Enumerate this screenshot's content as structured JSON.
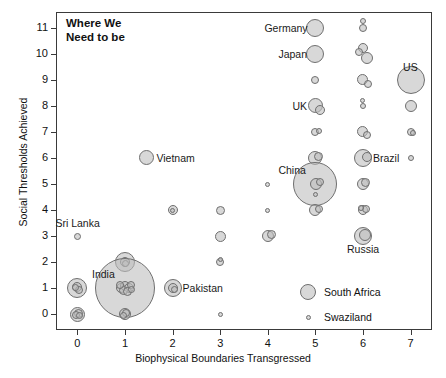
{
  "chart_data": {
    "type": "scatter",
    "title": "Where We\nNeed to be",
    "xlabel": "Biophysical Boundaries Transgressed",
    "ylabel": "Social Thresholds Achieved",
    "xlim": [
      -0.45,
      7.45
    ],
    "ylim": [
      -0.6,
      11.6
    ],
    "xticks": [
      0,
      1,
      2,
      3,
      4,
      5,
      6,
      7
    ],
    "yticks": [
      0,
      1,
      2,
      3,
      4,
      5,
      6,
      7,
      8,
      9,
      10,
      11
    ],
    "grid": false,
    "legend_position": "inside-bottom-right",
    "bubble_fill": "#bebebe",
    "bubble_stroke": "#6f6f6f",
    "size_note": "bubble radius encodes population",
    "legend": [
      {
        "label": "South Africa",
        "r": 8
      },
      {
        "label": "Swaziland",
        "r": 2.5
      }
    ],
    "annotations": [
      {
        "label": "Germany",
        "x": 5,
        "y": 11,
        "side": "left"
      },
      {
        "label": "Japan",
        "x": 5,
        "y": 10,
        "side": "left"
      },
      {
        "label": "US",
        "x": 7,
        "y": 9,
        "side": "above"
      },
      {
        "label": "UK",
        "x": 5,
        "y": 8,
        "side": "left"
      },
      {
        "label": "Brazil",
        "x": 6,
        "y": 6,
        "side": "right"
      },
      {
        "label": "China",
        "x": 5,
        "y": 5,
        "side": "above-left"
      },
      {
        "label": "Russia",
        "x": 6,
        "y": 3,
        "side": "below"
      },
      {
        "label": "Vietnam",
        "x": 1.45,
        "y": 6,
        "side": "right"
      },
      {
        "label": "Sri Lanka",
        "x": 0,
        "y": 3,
        "side": "above"
      },
      {
        "label": "India",
        "x": 1,
        "y": 1,
        "side": "above-left"
      },
      {
        "label": "Pakistan",
        "x": 2,
        "y": 1,
        "side": "right"
      }
    ],
    "points": [
      {
        "x": 5,
        "y": 11,
        "r": 9
      },
      {
        "x": 6,
        "y": 11,
        "r": 4
      },
      {
        "x": 6,
        "y": 11.25,
        "r": 3
      },
      {
        "x": 5,
        "y": 10,
        "r": 9
      },
      {
        "x": 6,
        "y": 10.2,
        "r": 5
      },
      {
        "x": 6.08,
        "y": 9.85,
        "r": 6
      },
      {
        "x": 5.92,
        "y": 10.05,
        "r": 4
      },
      {
        "x": 5,
        "y": 9,
        "r": 4
      },
      {
        "x": 6,
        "y": 9,
        "r": 5.5
      },
      {
        "x": 6.1,
        "y": 8.85,
        "r": 4
      },
      {
        "x": 7,
        "y": 9,
        "r": 14
      },
      {
        "x": 5,
        "y": 8,
        "r": 7.5
      },
      {
        "x": 5.1,
        "y": 7.85,
        "r": 5
      },
      {
        "x": 6,
        "y": 8,
        "r": 3
      },
      {
        "x": 6,
        "y": 8.2,
        "r": 2.5
      },
      {
        "x": 7,
        "y": 8,
        "r": 6
      },
      {
        "x": 5,
        "y": 7,
        "r": 4
      },
      {
        "x": 5.08,
        "y": 7.05,
        "r": 3
      },
      {
        "x": 6,
        "y": 7,
        "r": 5.5
      },
      {
        "x": 6.08,
        "y": 6.9,
        "r": 4
      },
      {
        "x": 7,
        "y": 7,
        "r": 4
      },
      {
        "x": 7.05,
        "y": 6.95,
        "r": 3
      },
      {
        "x": 5,
        "y": 6,
        "r": 7
      },
      {
        "x": 5.06,
        "y": 6.05,
        "r": 4.5
      },
      {
        "x": 6,
        "y": 6,
        "r": 9
      },
      {
        "x": 6.08,
        "y": 6.05,
        "r": 5
      },
      {
        "x": 7,
        "y": 6,
        "r": 3
      },
      {
        "x": 5,
        "y": 5,
        "r": 22
      },
      {
        "x": 5.02,
        "y": 5.0,
        "r": 6
      },
      {
        "x": 5.1,
        "y": 5.08,
        "r": 4
      },
      {
        "x": 6,
        "y": 5,
        "r": 6
      },
      {
        "x": 6.06,
        "y": 5.06,
        "r": 4.5
      },
      {
        "x": 4,
        "y": 5,
        "r": 2.5
      },
      {
        "x": 1.45,
        "y": 6,
        "r": 7.5
      },
      {
        "x": 6,
        "y": 4,
        "r": 5
      },
      {
        "x": 6.06,
        "y": 4.06,
        "r": 4
      },
      {
        "x": 5.95,
        "y": 4.08,
        "r": 3
      },
      {
        "x": 2,
        "y": 4,
        "r": 5
      },
      {
        "x": 2,
        "y": 4,
        "r": 2.5
      },
      {
        "x": 3,
        "y": 4,
        "r": 4.5
      },
      {
        "x": 4,
        "y": 4,
        "r": 2.5
      },
      {
        "x": 0,
        "y": 3,
        "r": 3.5
      },
      {
        "x": 3,
        "y": 3,
        "r": 5.5
      },
      {
        "x": 4,
        "y": 3,
        "r": 6
      },
      {
        "x": 4.08,
        "y": 3.05,
        "r": 4.5
      },
      {
        "x": 6,
        "y": 3,
        "r": 9
      },
      {
        "x": 6.05,
        "y": 3.05,
        "r": 6
      },
      {
        "x": 5,
        "y": 4,
        "r": 6
      },
      {
        "x": 5.08,
        "y": 4.05,
        "r": 4
      },
      {
        "x": 1,
        "y": 2,
        "r": 10
      },
      {
        "x": 1,
        "y": 2,
        "r": 5
      },
      {
        "x": 1.02,
        "y": 1.97,
        "r": 3.5
      },
      {
        "x": 3,
        "y": 2,
        "r": 4
      },
      {
        "x": 3,
        "y": 2.1,
        "r": 2.5
      },
      {
        "x": 1,
        "y": 1,
        "r": 30
      },
      {
        "x": 0.92,
        "y": 1.0,
        "r": 5
      },
      {
        "x": 1.0,
        "y": 1.08,
        "r": 5
      },
      {
        "x": 1.08,
        "y": 1.02,
        "r": 5
      },
      {
        "x": 0.96,
        "y": 0.9,
        "r": 4.5
      },
      {
        "x": 1.05,
        "y": 0.88,
        "r": 4.5
      },
      {
        "x": 1.12,
        "y": 1.12,
        "r": 4
      },
      {
        "x": 0.9,
        "y": 1.12,
        "r": 4
      },
      {
        "x": 1.14,
        "y": 0.95,
        "r": 3.5
      },
      {
        "x": 0,
        "y": 1,
        "r": 10
      },
      {
        "x": 0,
        "y": 1.05,
        "r": 5
      },
      {
        "x": 0.04,
        "y": 0.95,
        "r": 4
      },
      {
        "x": -0.04,
        "y": 1.02,
        "r": 3.5
      },
      {
        "x": 2,
        "y": 1,
        "r": 9
      },
      {
        "x": 2,
        "y": 1.02,
        "r": 5
      },
      {
        "x": 2.04,
        "y": 0.96,
        "r": 3.5
      },
      {
        "x": 0,
        "y": 0,
        "r": 7.5
      },
      {
        "x": 0.03,
        "y": 0.05,
        "r": 4.5
      },
      {
        "x": -0.03,
        "y": -0.03,
        "r": 4
      },
      {
        "x": 0.05,
        "y": -0.05,
        "r": 3.5
      },
      {
        "x": 1,
        "y": 0,
        "r": 6
      },
      {
        "x": 1.03,
        "y": 0.04,
        "r": 4
      },
      {
        "x": 0.97,
        "y": -0.03,
        "r": 3.5
      },
      {
        "x": 3,
        "y": 0,
        "r": 2.5
      },
      {
        "x": 5,
        "y": 4.6,
        "r": 2.5
      }
    ]
  },
  "axis": {
    "xtick_labels": [
      "0",
      "1",
      "2",
      "3",
      "4",
      "5",
      "6",
      "7"
    ],
    "ytick_labels": [
      "0",
      "1",
      "2",
      "3",
      "4",
      "5",
      "6",
      "7",
      "8",
      "9",
      "10",
      "11"
    ]
  }
}
